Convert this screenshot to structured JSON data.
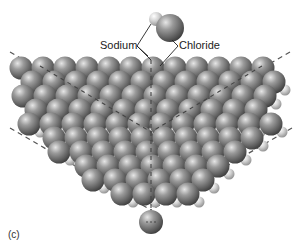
{
  "figure": {
    "panel_label": "(c)",
    "labels": {
      "sodium": "Sodium",
      "chloride": "Chloride"
    },
    "colors": {
      "chloride_sphere": "#6e6e6e",
      "sodium_sphere": "#c8c8c8",
      "axis_dash": "#555555",
      "leader_line": "#222222",
      "background": "#ffffff"
    }
  }
}
